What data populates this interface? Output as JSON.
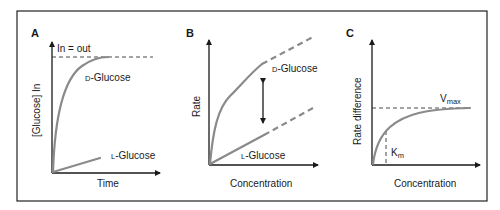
{
  "figure": {
    "colors": {
      "axis": "#1a1a1a",
      "curve": "#8a8a8a",
      "text": "#1a1a1a",
      "background": "#ffffff"
    },
    "panels": [
      {
        "letter": "A",
        "xlabel": "Time",
        "ylabel": "[Glucose] In",
        "annotations": {
          "plateau": "In = out"
        },
        "series": [
          {
            "prefix": "D",
            "name": "-Glucose",
            "shape": "saturating curve to plateau"
          },
          {
            "prefix": "L",
            "name": "-Glucose",
            "shape": "slow linear rise"
          }
        ]
      },
      {
        "letter": "B",
        "xlabel": "Concentration",
        "ylabel": "Rate",
        "series": [
          {
            "prefix": "D",
            "name": "-Glucose",
            "shape": "saturating then linear (dashed extension)"
          },
          {
            "prefix": "L",
            "name": "-Glucose",
            "shape": "linear (dashed extension)"
          }
        ],
        "annotations": {
          "arrow": "double-headed arrow indicating rate difference"
        }
      },
      {
        "letter": "C",
        "xlabel": "Concentration",
        "ylabel": "Rate difference",
        "annotations": {
          "vmax_main": "V",
          "vmax_sub": "max",
          "km_main": "K",
          "km_sub": "m"
        },
        "series": [
          {
            "name": "Rate difference",
            "shape": "hyperbolic saturation to Vmax"
          }
        ]
      }
    ]
  }
}
